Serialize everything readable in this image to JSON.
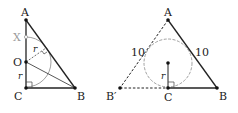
{
  "figure_left": {
    "labels": {
      "A": "A",
      "X": "X",
      "O": "O",
      "C": "C",
      "B": "B",
      "r1": "r",
      "r2": "r"
    }
  },
  "figure_right": {
    "labels": {
      "A": "A",
      "B_prime": "B′",
      "C": "C",
      "B": "B",
      "r": "r",
      "side_left": "10",
      "side_right": "10"
    }
  },
  "colors": {
    "line": "#222222",
    "gray": "#9a9a9a"
  }
}
